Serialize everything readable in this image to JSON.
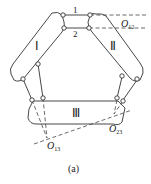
{
  "diagram": {
    "links": [
      {
        "id": "1",
        "label": "1"
      },
      {
        "id": "2",
        "label": "2"
      }
    ],
    "bodies": [
      {
        "id": "I",
        "label": "Ⅰ"
      },
      {
        "id": "II",
        "label": "Ⅱ"
      },
      {
        "id": "III",
        "label": "Ⅲ"
      }
    ],
    "points": [
      {
        "id": "O12",
        "main": "O",
        "sub": "12"
      },
      {
        "id": "O13",
        "main": "O",
        "sub": "13"
      },
      {
        "id": "O23",
        "main": "O",
        "sub": "23"
      }
    ],
    "caption": "(a)",
    "colors": {
      "stroke": "#333333",
      "background": "#ffffff"
    }
  }
}
